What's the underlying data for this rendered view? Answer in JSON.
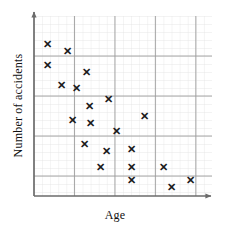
{
  "chart_data": {
    "type": "scatter",
    "title": "",
    "xlabel": "Age",
    "ylabel": "Number of accidents",
    "grid": true,
    "legend": null,
    "xlim": [
      0,
      22
    ],
    "ylim": [
      0,
      22.5
    ],
    "axis_ticks_shown": false,
    "x_major_interval": 5,
    "y_major_interval": 5,
    "minor_grid_interval": 1,
    "marker": "x",
    "marker_color": "#1a1a1a",
    "points": [
      {
        "x": 1.7,
        "y": 19.0
      },
      {
        "x": 4.1,
        "y": 18.1
      },
      {
        "x": 1.7,
        "y": 16.3
      },
      {
        "x": 6.5,
        "y": 15.5
      },
      {
        "x": 3.4,
        "y": 13.8
      },
      {
        "x": 5.3,
        "y": 13.5
      },
      {
        "x": 9.2,
        "y": 12.1
      },
      {
        "x": 4.8,
        "y": 9.5
      },
      {
        "x": 7.0,
        "y": 9.1
      },
      {
        "x": 10.2,
        "y": 8.1
      },
      {
        "x": 6.3,
        "y": 6.4
      },
      {
        "x": 9.0,
        "y": 5.6
      },
      {
        "x": 12.0,
        "y": 5.8
      },
      {
        "x": 8.2,
        "y": 3.6
      },
      {
        "x": 12.0,
        "y": 3.6
      },
      {
        "x": 16.0,
        "y": 3.6
      },
      {
        "x": 12.0,
        "y": 2.0
      },
      {
        "x": 19.3,
        "y": 2.0
      },
      {
        "x": 17.0,
        "y": 1.1
      }
    ],
    "extra_points": [
      {
        "x": 13.7,
        "y": 10.0
      },
      {
        "x": 6.8,
        "y": 11.2
      }
    ],
    "point_count": 21,
    "colors": {
      "marker": "#1a1a1a",
      "axis": "#6b6b6b",
      "major_grid": "#9a9a9a",
      "minor_grid": "#dcdcdc",
      "background": "#ffffff",
      "text": "#111111"
    }
  },
  "axis_labels": {
    "x": "Age",
    "y": "Number of accidents"
  }
}
